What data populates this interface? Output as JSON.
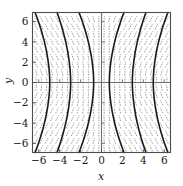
{
  "chart_data": {
    "type": "line",
    "title": "",
    "subtitle": "",
    "xlabel": "x",
    "ylabel": "y",
    "xlim": [
      -6.6,
      6.6
    ],
    "ylim": [
      -6.9,
      6.9
    ],
    "xticks": [
      -6,
      -4,
      -2,
      0,
      2,
      4,
      6
    ],
    "yticks": [
      -6,
      -4,
      -2,
      0,
      2,
      4,
      6
    ],
    "xtick_labels": [
      "−6",
      "−4",
      "−2",
      "0",
      "2",
      "4",
      "6"
    ],
    "ytick_labels": [
      "−6",
      "−4",
      "−2",
      "0",
      "2",
      "4",
      "6"
    ],
    "grid": false,
    "legend": null,
    "axes_through_origin": true,
    "slope_field": {
      "style": "dashed",
      "color": "#8c8c8c",
      "x_samples": [
        -6.25,
        -5.75,
        -5.25,
        -4.75,
        -4.25,
        -3.75,
        -3.25,
        -2.75,
        -2.25,
        -1.75,
        -1.25,
        -0.75,
        -0.25,
        0.25,
        0.75,
        1.25,
        1.75,
        2.25,
        2.75,
        3.25,
        3.75,
        4.25,
        4.75,
        5.25,
        5.75,
        6.25
      ],
      "y_samples": [
        -6.5,
        -5.75,
        -5.0,
        -4.25,
        -3.5,
        -2.75,
        -2.0,
        -1.25,
        -0.5,
        0.25,
        1.0,
        1.75,
        2.5,
        3.25,
        4.0,
        4.75,
        5.5,
        6.25
      ],
      "segment_length": 0.62,
      "slope_rule": "dx/dy = k*x*y, near-vertical tangents; tilt reverses across both axes"
    },
    "solution_curves": {
      "color": "#1a1a1a",
      "width": 1.6,
      "count": 6,
      "curves": [
        {
          "name": "curve-1",
          "x_at_ymax": -6.35,
          "x_at_y0": -4.95,
          "x_at_ymin": -6.35
        },
        {
          "name": "curve-2",
          "x_at_ymax": -4.25,
          "x_at_y0": -2.95,
          "x_at_ymin": -4.25
        },
        {
          "name": "curve-3",
          "x_at_ymax": -2.15,
          "x_at_y0": -0.75,
          "x_at_ymin": -2.15
        },
        {
          "name": "curve-4",
          "x_at_ymax": 2.15,
          "x_at_y0": 0.75,
          "x_at_ymin": 2.15
        },
        {
          "name": "curve-5",
          "x_at_ymax": 4.25,
          "x_at_y0": 2.95,
          "x_at_ymin": 4.25
        },
        {
          "name": "curve-6",
          "x_at_ymax": 6.35,
          "x_at_y0": 4.95,
          "x_at_ymin": 6.35
        }
      ]
    },
    "colors": {
      "frame": "#4d4d4d",
      "axis": "#6e6e6e",
      "slope_field": "#8c8c8c",
      "curve": "#1a1a1a",
      "background": "#ffffff",
      "text": "#1a1a1a"
    }
  }
}
